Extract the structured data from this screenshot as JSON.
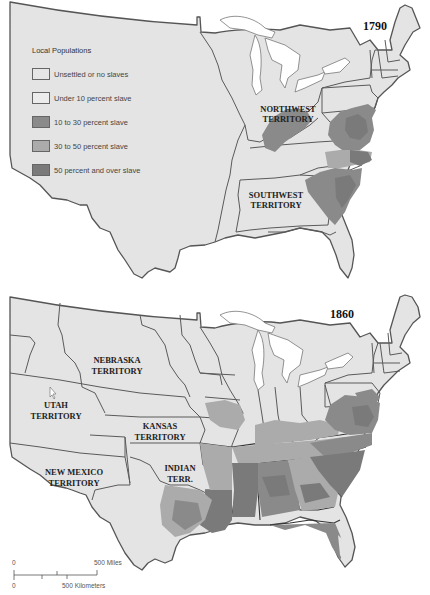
{
  "maps": [
    {
      "year": "1790",
      "territories": [
        "NORTHWEST",
        "TERRITORY",
        "SOUTHWEST",
        "TERRITORY"
      ]
    },
    {
      "year": "1860",
      "territories": [
        "NEBRASKA",
        "TERRITORY",
        "UTAH",
        "TERRITORY",
        "KANSAS",
        "TERRITORY",
        "NEW MEXICO",
        "TERRITORY",
        "INDIAN",
        "TERR."
      ]
    }
  ],
  "legend": {
    "title": "Local Populations",
    "items": [
      {
        "label": "Unsettled or no slaves",
        "color": "#e6e6e6"
      },
      {
        "label": "Under 10 percent slave",
        "color": "#ececec"
      },
      {
        "label": "10 to 30 percent slave",
        "color": "#8a8a8a"
      },
      {
        "label": "30 to 50 percent slave",
        "color": "#ababab"
      },
      {
        "label": "50 percent and over slave",
        "color": "#7a7a7a"
      }
    ]
  },
  "scale_bar": {
    "zero_top": "0",
    "zero_bottom": "0",
    "miles_label": "500 Miles",
    "km_label": "500 Kilometers"
  },
  "colors": {
    "land": "#e4e4e4",
    "slave_10_30": "#8a8a8a",
    "slave_30_50": "#ababab",
    "slave_50_plus": "#7a7a7a",
    "water": "#ffffff"
  }
}
